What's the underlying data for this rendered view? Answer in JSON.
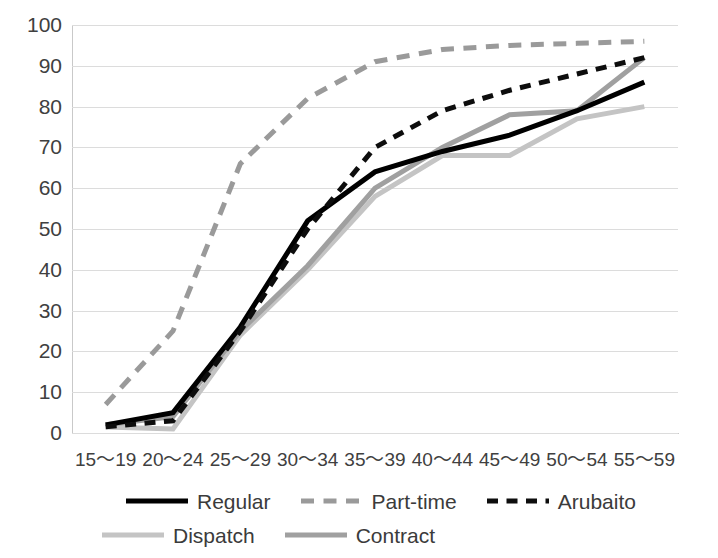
{
  "chart_data": {
    "type": "line",
    "title": "",
    "xlabel": "",
    "ylabel": "",
    "ylim": [
      0,
      100
    ],
    "ytick_step": 10,
    "grid": true,
    "legend_position": "bottom",
    "categories": [
      "15～19",
      "20～24",
      "25～29",
      "30～34",
      "35～39",
      "40～44",
      "45～49",
      "50～54",
      "55～59"
    ],
    "yticks": [
      "0",
      "10",
      "20",
      "30",
      "40",
      "50",
      "60",
      "70",
      "80",
      "90",
      "100"
    ],
    "series": [
      {
        "name": "Regular",
        "color": "#000000",
        "style": "solid",
        "width": 5,
        "values": [
          2,
          5,
          26,
          52,
          64,
          69,
          73,
          79,
          86
        ]
      },
      {
        "name": "Part-time",
        "color": "#9a9a9a",
        "style": "dashed-long",
        "width": 5,
        "values": [
          7,
          25,
          66,
          82,
          91,
          94,
          95,
          95.5,
          96
        ]
      },
      {
        "name": "Arubaito",
        "color": "#0d0d0d",
        "style": "dashed",
        "width": 5,
        "values": [
          1.5,
          3,
          25,
          50,
          70,
          79,
          84,
          88,
          92
        ]
      },
      {
        "name": "Dispatch",
        "color": "#c4c4c4",
        "style": "solid",
        "width": 5,
        "values": [
          1.5,
          1,
          24,
          40,
          58,
          68,
          68,
          77,
          80
        ]
      },
      {
        "name": "Contract",
        "color": "#a0a0a0",
        "style": "solid",
        "width": 5,
        "values": [
          2,
          4,
          25,
          41,
          60,
          70,
          78,
          79,
          92
        ]
      }
    ]
  },
  "legend": {
    "rows": [
      [
        "Regular",
        "Part-time",
        "Arubaito"
      ],
      [
        "Dispatch",
        "Contract"
      ]
    ]
  }
}
